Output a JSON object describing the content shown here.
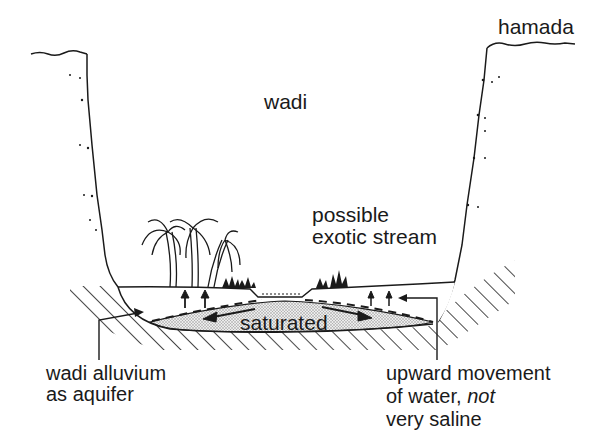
{
  "diagram": {
    "labels": {
      "hamada": "hamada",
      "wadi": "wadi",
      "stream_line1": "possible",
      "stream_line2": "exotic stream",
      "saturated": "saturated",
      "alluvium_line1": "wadi alluvium",
      "alluvium_line2": "as aquifer",
      "upward_line1": "upward movement",
      "upward_line2_a": "of water, ",
      "upward_line2_b": "not",
      "upward_line3": "very saline"
    },
    "colors": {
      "ink": "#1a1a1a",
      "background": "#ffffff",
      "saturated_fill": "#cfcfcf"
    },
    "elements": [
      "hamada-plateau-left",
      "hamada-plateau-right",
      "wadi-wall-left",
      "wadi-wall-right",
      "bedrock-hatching",
      "alluvium-fill",
      "saturated-zone",
      "water-table-dashed",
      "palm-trees",
      "shrubs",
      "stream-channel",
      "upward-arrows",
      "flow-arrows"
    ]
  }
}
